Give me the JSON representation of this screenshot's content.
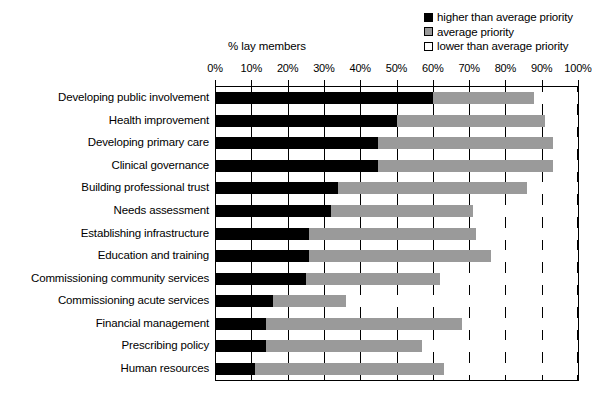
{
  "axis_title": "% lay members",
  "legend": {
    "position": "top-right",
    "items": [
      {
        "label": "higher than average priority",
        "swatch": "black-square-icon",
        "color": "#000000"
      },
      {
        "label": "average priority",
        "swatch": "gray-square-icon",
        "color": "#9a9a9a"
      },
      {
        "label": "lower than average priority",
        "swatch": "white-square-icon",
        "color": "#ffffff"
      }
    ]
  },
  "chart_data": {
    "type": "bar",
    "orientation": "horizontal",
    "stacked": true,
    "stack_total": 100,
    "title": "",
    "subtitle": "",
    "xlabel": "% lay members",
    "ylabel": "",
    "xlim": [
      0,
      100
    ],
    "xticks": [
      0,
      10,
      20,
      30,
      40,
      50,
      60,
      70,
      80,
      90,
      100
    ],
    "xtick_labels": [
      "0%",
      "10%",
      "20%",
      "30%",
      "40%",
      "50%",
      "60%",
      "70%",
      "80%",
      "90%",
      "100%"
    ],
    "grid": true,
    "grid_axis": "x",
    "legend_position": "top-right",
    "categories": [
      "Developing public involvement",
      "Health improvement",
      "Developing primary care",
      "Clinical governance",
      "Building professional trust",
      "Needs assessment",
      "Establishing infrastructure",
      "Education and training",
      "Commissioning community services",
      "Commissioning acute services",
      "Financial management",
      "Prescribing policy",
      "Human resources"
    ],
    "series": [
      {
        "name": "higher than average priority",
        "color": "#000000",
        "values": [
          60,
          50,
          45,
          45,
          34,
          32,
          26,
          26,
          25,
          16,
          14,
          14,
          11
        ]
      },
      {
        "name": "average priority",
        "color": "#9a9a9a",
        "values": [
          28,
          41,
          48,
          48,
          52,
          39,
          46,
          50,
          37,
          20,
          54,
          43,
          52
        ]
      },
      {
        "name": "lower than average priority",
        "color": "#ffffff",
        "values": [
          12,
          9,
          7,
          7,
          14,
          29,
          28,
          24,
          38,
          64,
          32,
          43,
          37
        ]
      }
    ]
  }
}
